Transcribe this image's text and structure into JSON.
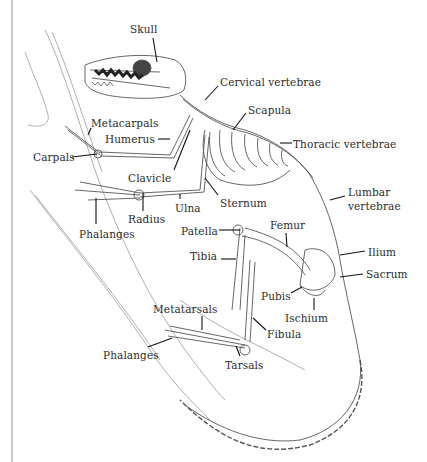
{
  "figure": {
    "labels": [
      {
        "id": "skull",
        "text": "Skull",
        "x": 130,
        "y": 23
      },
      {
        "id": "cervical-vertebrae",
        "text": "Cervical vertebrae",
        "x": 220,
        "y": 76
      },
      {
        "id": "scapula",
        "text": "Scapula",
        "x": 248,
        "y": 104
      },
      {
        "id": "thoracic-vertebrae",
        "text": "Thoracic vertebrae",
        "x": 293,
        "y": 138
      },
      {
        "id": "lumbar-vertebrae-1",
        "text": "Lumbar",
        "x": 348,
        "y": 186
      },
      {
        "id": "lumbar-vertebrae-2",
        "text": "vertebrae",
        "x": 348,
        "y": 200
      },
      {
        "id": "ilium",
        "text": "Ilium",
        "x": 368,
        "y": 246
      },
      {
        "id": "sacrum",
        "text": "Sacrum",
        "x": 366,
        "y": 268
      },
      {
        "id": "pubis",
        "text": "Pubis",
        "x": 261,
        "y": 290
      },
      {
        "id": "ischium",
        "text": "Ischium",
        "x": 285,
        "y": 312
      },
      {
        "id": "fibula",
        "text": "Fibula",
        "x": 267,
        "y": 328
      },
      {
        "id": "tarsals",
        "text": "Tarsals",
        "x": 225,
        "y": 359
      },
      {
        "id": "metatarsals",
        "text": "Metatarsals",
        "x": 153,
        "y": 303
      },
      {
        "id": "phalanges-hind",
        "text": "Phalanges",
        "x": 103,
        "y": 349
      },
      {
        "id": "femur",
        "text": "Femur",
        "x": 270,
        "y": 219
      },
      {
        "id": "patella",
        "text": "Patella",
        "x": 181,
        "y": 225
      },
      {
        "id": "tibia",
        "text": "Tibia",
        "x": 190,
        "y": 250
      },
      {
        "id": "sternum",
        "text": "Sternum",
        "x": 220,
        "y": 197
      },
      {
        "id": "ulna",
        "text": "Ulna",
        "x": 175,
        "y": 202
      },
      {
        "id": "radius",
        "text": "Radius",
        "x": 128,
        "y": 213
      },
      {
        "id": "phalanges-fore",
        "text": "Phalanges",
        "x": 79,
        "y": 228
      },
      {
        "id": "clavicle",
        "text": "Clavicle",
        "x": 128,
        "y": 172
      },
      {
        "id": "carpals",
        "text": "Carpals",
        "x": 33,
        "y": 151
      },
      {
        "id": "humerus",
        "text": "Humerus",
        "x": 105,
        "y": 133
      },
      {
        "id": "metacarpals",
        "text": "Metacarpals",
        "x": 91,
        "y": 117
      }
    ],
    "colors": {
      "ink": "#2a2a2a",
      "bone_line": "#555555",
      "branch_line": "#9a9a9a",
      "border": "#c8c8c8"
    }
  }
}
